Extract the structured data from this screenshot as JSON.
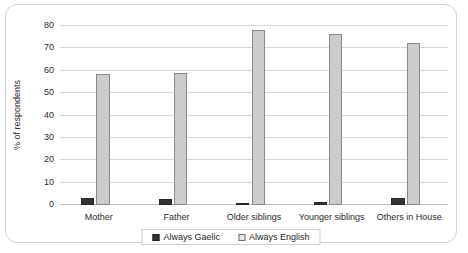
{
  "chart_data": {
    "type": "bar",
    "title": "",
    "xlabel": "",
    "ylabel": "% of respondents",
    "ylim": [
      0,
      80
    ],
    "ytick_step": 10,
    "yticks": [
      "0",
      "10",
      "20",
      "30",
      "40",
      "50",
      "60",
      "70",
      "80"
    ],
    "grid": true,
    "legend_position": "bottom",
    "categories": [
      "Mother",
      "Father",
      "Older siblings",
      "Younger siblings",
      "Others in House"
    ],
    "series": [
      {
        "name": "Always Gaelic",
        "color": "#333333",
        "values": [
          3,
          2.5,
          1,
          1.3,
          3
        ]
      },
      {
        "name": "Always English",
        "color": "#cccccc",
        "values": [
          58.5,
          59,
          78,
          76.5,
          72.5
        ]
      }
    ]
  },
  "legend": {
    "items": [
      {
        "label": "Always Gaelic",
        "swatch": "filled-dark-square-icon"
      },
      {
        "label": "Always English",
        "swatch": "outlined-light-square-icon"
      }
    ]
  }
}
